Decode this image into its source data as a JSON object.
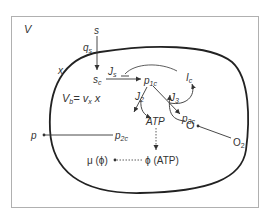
{
  "diagram": {
    "outer_label": "V",
    "cell_label": "x",
    "substrate": {
      "outside": "s",
      "uptake": "q",
      "uptake_sub": "s",
      "inside": "s",
      "inside_sub": "c"
    },
    "fluxes": {
      "js": "J",
      "js_sub": "s",
      "j2": "J",
      "j2_sub": "2",
      "j3": "J",
      "j3_sub": "3"
    },
    "metabolites": {
      "p1c": "p",
      "p1c_sub": "1c",
      "p2c": "p",
      "p2c_sub": "2c",
      "p3c": "p",
      "p3c_sub": "3c",
      "ic": "I",
      "ic_sub": "c",
      "atp": "ATP",
      "o": "O",
      "o2": "O",
      "o2_sub": "2"
    },
    "product": {
      "outside": "p"
    },
    "production_rate": {
      "lhs": "V",
      "lhs_sub": "b",
      "eq": "= v",
      "v_sub": "x",
      "rhs": " x"
    },
    "growth": {
      "mu": "μ (ϕ)",
      "phi": "ϕ (ATP)"
    },
    "colors": {
      "line": "#333333",
      "frame": "#b0b0b0",
      "cell": "#222222",
      "background": "#ffffff"
    }
  }
}
